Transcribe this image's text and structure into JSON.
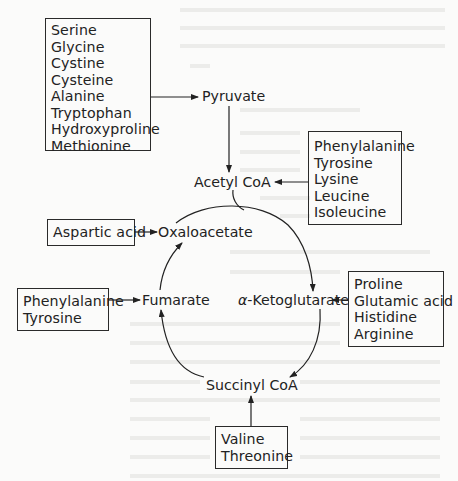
{
  "diagram": {
    "nodes": {
      "pyruvate": "Pyruvate",
      "acetyl_coa": "Acetyl CoA",
      "oxaloacetate": "Oxaloacetate",
      "fumarate": "Fumarate",
      "alpha_ketoglutarate_prefix": "α",
      "alpha_ketoglutarate": "-Ketoglutarate",
      "succinyl_coa": "Succinyl CoA"
    },
    "source_boxes": {
      "to_pyruvate": [
        "Serine",
        "Glycine",
        "Cystine",
        "Cysteine",
        "Alanine",
        "Tryptophan",
        "Hydroxyproline",
        "Methionine"
      ],
      "to_acetyl_coa": [
        "Phenylalanine",
        "Tyrosine",
        "Lysine",
        "Leucine",
        "Isoleucine"
      ],
      "to_oxaloacetate": [
        "Aspartic acid"
      ],
      "to_fumarate": [
        "Phenylalanine",
        "Tyrosine"
      ],
      "to_alpha_ketoglutarate": [
        "Proline",
        "Glutamic acid",
        "Histidine",
        "Arginine"
      ],
      "to_succinyl_coa": [
        "Valine",
        "Threonine"
      ]
    },
    "edges": [
      {
        "from": "to_pyruvate box",
        "to": "Pyruvate"
      },
      {
        "from": "Pyruvate",
        "to": "Acetyl CoA"
      },
      {
        "from": "to_acetyl_coa box",
        "to": "Acetyl CoA"
      },
      {
        "from": "Acetyl CoA",
        "to": "cycle"
      },
      {
        "from": "to_oxaloacetate box",
        "to": "Oxaloacetate"
      },
      {
        "from": "Oxaloacetate",
        "to": "α-Ketoglutarate"
      },
      {
        "from": "α-Ketoglutarate",
        "to": "Succinyl CoA"
      },
      {
        "from": "Succinyl CoA",
        "to": "Fumarate"
      },
      {
        "from": "Fumarate",
        "to": "Oxaloacetate"
      },
      {
        "from": "to_fumarate box",
        "to": "Fumarate"
      },
      {
        "from": "to_alpha_ketoglutarate box",
        "to": "α-Ketoglutarate"
      },
      {
        "from": "to_succinyl_coa box",
        "to": "Succinyl CoA"
      }
    ]
  }
}
